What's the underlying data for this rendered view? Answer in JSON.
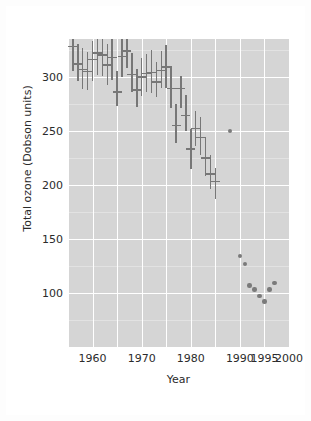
{
  "chart_data": {
    "type": "scatter",
    "title": "",
    "xlabel": "Year",
    "ylabel": "Total ozone (Dobson units)",
    "xlim": [
      1955,
      2000
    ],
    "ylim": [
      50,
      335
    ],
    "grid": true,
    "legend": null,
    "xticks": [
      {
        "value": 1960,
        "label": "1960"
      },
      {
        "value": 1970,
        "label": "1970"
      },
      {
        "value": 1980,
        "label": "1980"
      },
      {
        "value": 1990,
        "label": "1990"
      },
      {
        "value": 1995,
        "label": "1995"
      },
      {
        "value": 2000,
        "label": "2000"
      }
    ],
    "yticks": [
      {
        "value": 300,
        "label": "300"
      },
      {
        "value": 250,
        "label": "250"
      },
      {
        "value": 200,
        "label": "200"
      },
      {
        "value": 150,
        "label": "150"
      },
      {
        "value": 100,
        "label": "100"
      }
    ],
    "x_major_gridlines": [
      1955,
      1960,
      1965,
      1970,
      1975,
      1980,
      1985,
      1990,
      1995,
      2000
    ],
    "y_major_gridlines": [
      100,
      150,
      200,
      250,
      300
    ],
    "y_minor_gridlines": [
      75,
      125,
      175,
      225,
      275,
      325
    ],
    "series": [
      {
        "name": "Mean total ozone with range",
        "marker": "errorbar",
        "color": "#777777",
        "points": [
          {
            "x": 1956,
            "y": 328,
            "low": 305,
            "high": 347
          },
          {
            "x": 1957,
            "y": 312,
            "low": 296,
            "high": 330
          },
          {
            "x": 1958,
            "y": 307,
            "low": 289,
            "high": 327
          },
          {
            "x": 1959,
            "y": 305,
            "low": 288,
            "high": 323
          },
          {
            "x": 1960,
            "y": 316,
            "low": 296,
            "high": 333
          },
          {
            "x": 1961,
            "y": 322,
            "low": 302,
            "high": 341
          },
          {
            "x": 1962,
            "y": 320,
            "low": 301,
            "high": 349
          },
          {
            "x": 1963,
            "y": 311,
            "low": 292,
            "high": 330
          },
          {
            "x": 1964,
            "y": 318,
            "low": 297,
            "high": 338
          },
          {
            "x": 1965,
            "y": 286,
            "low": 273,
            "high": 305
          },
          {
            "x": 1966,
            "y": 319,
            "low": 300,
            "high": 344
          },
          {
            "x": 1967,
            "y": 324,
            "low": 308,
            "high": 342
          },
          {
            "x": 1968,
            "y": 302,
            "low": 286,
            "high": 322
          },
          {
            "x": 1969,
            "y": 288,
            "low": 272,
            "high": 307
          },
          {
            "x": 1970,
            "y": 300,
            "low": 282,
            "high": 317
          },
          {
            "x": 1971,
            "y": 303,
            "low": 286,
            "high": 321
          },
          {
            "x": 1972,
            "y": 304,
            "low": 285,
            "high": 325
          },
          {
            "x": 1973,
            "y": 295,
            "low": 281,
            "high": 314
          },
          {
            "x": 1974,
            "y": 306,
            "low": 290,
            "high": 324
          },
          {
            "x": 1975,
            "y": 309,
            "low": 290,
            "high": 329
          },
          {
            "x": 1976,
            "y": 289,
            "low": 271,
            "high": 310
          },
          {
            "x": 1977,
            "y": 255,
            "low": 239,
            "high": 275
          },
          {
            "x": 1978,
            "y": 289,
            "low": 271,
            "high": 301
          },
          {
            "x": 1979,
            "y": 264,
            "low": 250,
            "high": 283
          },
          {
            "x": 1980,
            "y": 233,
            "low": 215,
            "high": 252
          },
          {
            "x": 1981,
            "y": 252,
            "low": 236,
            "high": 268
          },
          {
            "x": 1982,
            "y": 244,
            "low": 228,
            "high": 263
          },
          {
            "x": 1983,
            "y": 225,
            "low": 208,
            "high": 244
          },
          {
            "x": 1984,
            "y": 210,
            "low": 196,
            "high": 228
          },
          {
            "x": 1985,
            "y": 203,
            "low": 187,
            "high": 216
          }
        ]
      },
      {
        "name": "Annual minimum total ozone",
        "marker": "dot",
        "color": "#7a7a7a",
        "points": [
          {
            "x": 1988,
            "y": 250
          },
          {
            "x": 1990,
            "y": 134
          },
          {
            "x": 1991,
            "y": 127
          },
          {
            "x": 1992,
            "y": 107
          },
          {
            "x": 1993,
            "y": 103
          },
          {
            "x": 1994,
            "y": 97
          },
          {
            "x": 1995,
            "y": 92
          },
          {
            "x": 1996,
            "y": 103
          },
          {
            "x": 1997,
            "y": 109
          }
        ]
      }
    ]
  }
}
